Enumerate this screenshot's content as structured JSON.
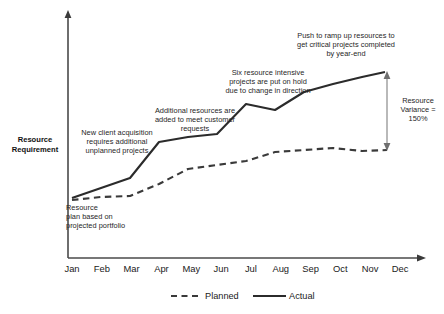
{
  "chart_data": {
    "type": "line",
    "title": "",
    "xlabel": "",
    "ylabel": "Resource\nRequirement",
    "categories": [
      "Jan",
      "Feb",
      "Mar",
      "Apr",
      "May",
      "Jun",
      "Jul",
      "Aug",
      "Sep",
      "Oct",
      "Nov",
      "Dec"
    ],
    "grid": false,
    "legend_position": "bottom",
    "xlim_labels": [
      "Jan",
      "Dec"
    ],
    "ylim": [
      0,
      100
    ],
    "series": [
      {
        "name": "Planned",
        "style": "dashed",
        "color": "#3a3a3a",
        "values": [
          10,
          13,
          15,
          22,
          31,
          34,
          37,
          46,
          49,
          51,
          55,
          55
        ],
        "points_px": [
          [
            72,
            200
          ],
          [
            101,
            197
          ],
          [
            130,
            196
          ],
          [
            159,
            184
          ],
          [
            188,
            169
          ],
          [
            217,
            165
          ],
          [
            246,
            161
          ],
          [
            275,
            152
          ],
          [
            304,
            150
          ],
          [
            333,
            148
          ],
          [
            362,
            151
          ],
          [
            387,
            150
          ]
        ]
      },
      {
        "name": "Actual",
        "style": "solid",
        "color": "#2b2b2b",
        "values": [
          10,
          18,
          26,
          49,
          53,
          56,
          73,
          69,
          82,
          90,
          97,
          97
        ],
        "points_px": [
          [
            72,
            198
          ],
          [
            101,
            188
          ],
          [
            130,
            178
          ],
          [
            159,
            142
          ],
          [
            188,
            137
          ],
          [
            217,
            134
          ],
          [
            246,
            104
          ],
          [
            275,
            110
          ],
          [
            304,
            92
          ],
          [
            333,
            84
          ],
          [
            362,
            77
          ],
          [
            385,
            72
          ]
        ]
      }
    ],
    "annotations": [
      {
        "id": "resource-plan",
        "text": "Resource\nplan based on\nprojected portfolio",
        "align": "left",
        "x": 66,
        "y": 203,
        "width": 110
      },
      {
        "id": "new-client-acquisition",
        "text": "New client acquisition\nrequires additional\nunplanned projects",
        "align": "center",
        "x": 62,
        "y": 128,
        "width": 110
      },
      {
        "id": "additional-resources",
        "text": "Additional resources are\nadded to meet customer\nrequests",
        "align": "center",
        "x": 140,
        "y": 106,
        "width": 110
      },
      {
        "id": "six-resource-intensive",
        "text": "Six resource intensive\nprojects are put on hold\ndue to change in direction",
        "align": "center",
        "x": 208,
        "y": 68,
        "width": 120
      },
      {
        "id": "push-to-ramp-up",
        "text": "Push to ramp up resources to\nget critical projects completed\nby year-end",
        "align": "center",
        "x": 276,
        "y": 31,
        "width": 140
      }
    ],
    "variance_marker": {
      "label": "Resource\nVariance =\n150%",
      "value": "150%",
      "x_px": 387,
      "y_top_px": 72,
      "y_bottom_px": 150
    }
  },
  "legend": {
    "items": [
      {
        "label": "Planned",
        "style": "dashed"
      },
      {
        "label": "Actual",
        "style": "solid"
      }
    ]
  },
  "colors": {
    "line": "#2b2b2b",
    "axis": "#4a4a4a",
    "text": "#1a1a1a",
    "background": "#ffffff"
  }
}
